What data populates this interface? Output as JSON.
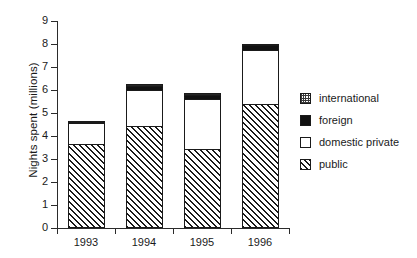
{
  "chart_data": {
    "type": "bar",
    "subtype": "stacked-bar",
    "title": "",
    "xlabel": "",
    "ylabel": "Nights spent (millions)",
    "categories": [
      "1993",
      "1994",
      "1995",
      "1996"
    ],
    "ylim": [
      0,
      9
    ],
    "ytick_labels": [
      "0",
      "1",
      "2",
      "3",
      "4",
      "5",
      "6",
      "7",
      "8",
      "9"
    ],
    "ytick_values": [
      0,
      1,
      2,
      3,
      4,
      5,
      6,
      7,
      8,
      9
    ],
    "grid": false,
    "legend_position": "right",
    "stack_order_bottom_to_top": [
      "public",
      "domestic private",
      "foreign",
      "international"
    ],
    "series": [
      {
        "name": "public",
        "pattern": "diagonal-hatch",
        "values": [
          3.6,
          4.4,
          3.4,
          5.35
        ]
      },
      {
        "name": "domestic private",
        "pattern": "solid-white",
        "values": [
          0.95,
          1.6,
          2.2,
          2.4
        ]
      },
      {
        "name": "foreign",
        "pattern": "solid-black",
        "values": [
          0.0,
          0.15,
          0.15,
          0.15
        ]
      },
      {
        "name": "international",
        "pattern": "checkerboard",
        "values": [
          0.1,
          0.1,
          0.1,
          0.1
        ]
      }
    ],
    "totals": [
      4.65,
      6.25,
      5.85,
      8.0
    ]
  },
  "legend": {
    "entries": [
      {
        "label": "international",
        "swatch": "checkerboard-swatch"
      },
      {
        "label": "foreign",
        "swatch": "solid-black-swatch"
      },
      {
        "label": "domestic private",
        "swatch": "solid-white-swatch"
      },
      {
        "label": "public",
        "swatch": "diagonal-hatch-swatch"
      }
    ]
  },
  "axes": {
    "y_title": "Nights spent (millions)"
  }
}
